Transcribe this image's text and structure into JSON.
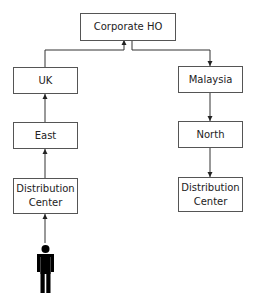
{
  "diagram": {
    "nodes": {
      "hq": "Corporate HO",
      "uk": "UK",
      "east": "East",
      "dc_left": "Distribution\nCenter",
      "malaysia": "Malaysia",
      "north": "North",
      "dc_right": "Distribution\nCenter"
    },
    "edges": [
      {
        "from": "person",
        "to": "dc_left"
      },
      {
        "from": "dc_left",
        "to": "east"
      },
      {
        "from": "east",
        "to": "uk"
      },
      {
        "from": "uk",
        "to": "hq"
      },
      {
        "from": "hq",
        "to": "malaysia"
      },
      {
        "from": "malaysia",
        "to": "north"
      },
      {
        "from": "north",
        "to": "dc_right"
      }
    ],
    "actor_icon": "person-icon"
  }
}
